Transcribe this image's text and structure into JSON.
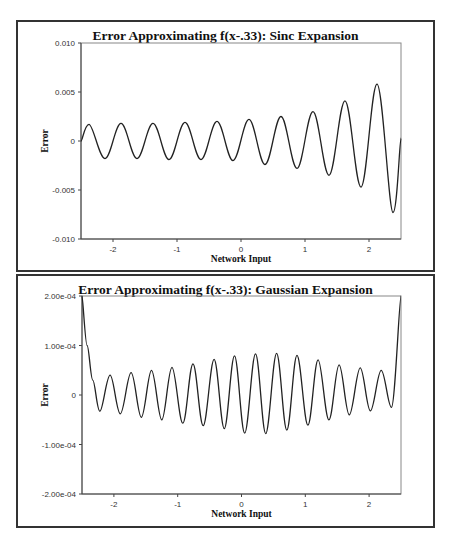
{
  "chart_data": [
    {
      "type": "line",
      "title": "Error Approximating f(x-.33):  Sinc Expansion",
      "xlabel": "Network Input",
      "ylabel": "Error",
      "xlim": [
        -2.5,
        2.5
      ],
      "ylim": [
        -0.01,
        0.01
      ],
      "x_ticks": [
        -2,
        -1,
        0,
        1,
        2
      ],
      "x_tick_labels": [
        "-2",
        "-1",
        "0",
        "1",
        "2"
      ],
      "y_ticks": [
        0.01,
        0.005,
        0,
        -0.005,
        -0.01
      ],
      "y_tick_labels": [
        "0.010",
        "0.005",
        "0",
        "-0.005",
        "-0.010"
      ],
      "grid": false,
      "series": [
        {
          "name": "error",
          "x": [
            -2.5,
            -2.375,
            -2.125,
            -1.875,
            -1.625,
            -1.375,
            -1.125,
            -0.875,
            -0.625,
            -0.375,
            -0.125,
            0.125,
            0.375,
            0.625,
            0.875,
            1.125,
            1.375,
            1.625,
            1.875,
            2.125,
            2.375,
            2.5
          ],
          "y": [
            0.0,
            0.0017,
            -0.0018,
            0.0018,
            -0.0018,
            0.0018,
            -0.0019,
            0.0019,
            -0.0019,
            0.002,
            -0.002,
            0.0022,
            -0.0024,
            0.0025,
            -0.0028,
            0.003,
            -0.0035,
            0.0041,
            -0.0047,
            0.0058,
            -0.0073,
            0.0003
          ]
        }
      ]
    },
    {
      "type": "line",
      "title": "Error Approximating f(x-.33):  Gaussian Expansion",
      "xlabel": "Network Input",
      "ylabel": "Error",
      "xlim": [
        -2.5,
        2.5
      ],
      "ylim": [
        -0.0002,
        0.0002
      ],
      "x_ticks": [
        -2,
        -1,
        0,
        1,
        2
      ],
      "x_tick_labels": [
        "-2",
        "-1",
        "0",
        "1",
        "2"
      ],
      "y_ticks": [
        0.0002,
        0.0001,
        0,
        -0.0001,
        -0.0002
      ],
      "y_tick_labels": [
        "2.00e-04",
        "1.00e-04",
        "0",
        "-1.00e-04",
        "-2.00e-04"
      ],
      "grid": false,
      "series": [
        {
          "name": "error",
          "x": [
            -2.5,
            -2.42,
            -2.33,
            -2.22,
            -2.06,
            -1.9,
            -1.73,
            -1.57,
            -1.41,
            -1.25,
            -1.09,
            -0.92,
            -0.76,
            -0.6,
            -0.43,
            -0.27,
            -0.11,
            0.05,
            0.22,
            0.38,
            0.55,
            0.71,
            0.87,
            1.04,
            1.2,
            1.37,
            1.53,
            1.69,
            1.86,
            2.02,
            2.19,
            2.35,
            2.5
          ],
          "y": [
            0.0002,
            0.0001,
            3e-05,
            -3.3e-05,
            4e-05,
            -3.8e-05,
            4.5e-05,
            -4.5e-05,
            5e-05,
            -5e-05,
            5.6e-05,
            -5.7e-05,
            6.3e-05,
            -6.2e-05,
            7.2e-05,
            -6.8e-05,
            7.9e-05,
            -7.7e-05,
            8.3e-05,
            -7.8e-05,
            8.4e-05,
            -7.1e-05,
            8e-05,
            -6.1e-05,
            7.1e-05,
            -5e-05,
            6.1e-05,
            -4e-05,
            5.5e-05,
            -3.2e-05,
            5e-05,
            -2.5e-05,
            0.0002
          ]
        }
      ]
    }
  ]
}
